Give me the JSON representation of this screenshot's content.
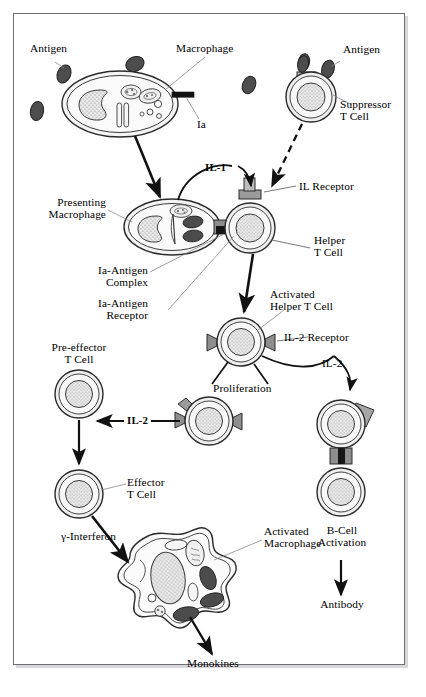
{
  "diagram": {
    "background": "#ffffff",
    "frame_color": "#6f6f72",
    "ink": "#1a1a1a",
    "cell_fill": "#f2f2f2",
    "nucleus_fill": "#e2e2e2",
    "receptor_fill": "#a8a8a8",
    "antigen_fill": "#4a4a4a"
  },
  "labels": {
    "antigen_left": "Antigen",
    "macrophage": "Macrophage",
    "antigen_right": "Antigen",
    "ia": "Ia",
    "suppressor_t_cell": "Suppressor\nT Cell",
    "il_1": "IL-1",
    "il_receptor": "IL Receptor",
    "presenting_macrophage": "Presenting\nMacrophage",
    "helper_t_cell": "Helper\nT Cell",
    "ia_antigen_complex": "Ia-Antigen\nComplex",
    "ia_antigen_receptor": "Ia-Antigen\nReceptor",
    "activated_helper_t_cell": "Activated\nHelper T Cell",
    "il_2_receptor": "IL-2 Receptor",
    "il_2_curve": "IL-2",
    "pre_effector_t_cell": "Pre-effector\nT Cell",
    "proliferation": "Proliferation",
    "il_2_arrow": "IL-2",
    "effector_t_cell": "Effector\nT Cell",
    "gamma_interferon": "γ-Interferon",
    "activated_macrophage": "Activated\nMacrophage",
    "monokines": "Monokines",
    "b_cell_activation": "B-Cell\nActivation",
    "antibody": "Antibody"
  },
  "cells": [
    {
      "name": "macrophage",
      "kind": "macrophage",
      "cx": 120,
      "cy": 104
    },
    {
      "name": "suppressor-t-cell",
      "kind": "t-cell",
      "cx": 311,
      "cy": 97
    },
    {
      "name": "presenting-macrophage",
      "kind": "macrophage",
      "cx": 172,
      "cy": 227
    },
    {
      "name": "helper-t-cell",
      "kind": "t-cell",
      "cx": 250,
      "cy": 228
    },
    {
      "name": "activated-helper-t-cell",
      "kind": "t-cell",
      "cx": 241,
      "cy": 342
    },
    {
      "name": "pre-effector-t-cell",
      "kind": "t-cell",
      "cx": 79,
      "cy": 394
    },
    {
      "name": "proliferating-t-cell",
      "kind": "t-cell",
      "cx": 209,
      "cy": 421
    },
    {
      "name": "effector-t-cell",
      "kind": "t-cell",
      "cx": 79,
      "cy": 494
    },
    {
      "name": "il2-bound-t-cell",
      "kind": "t-cell",
      "cx": 341,
      "cy": 424
    },
    {
      "name": "b-cell",
      "kind": "t-cell",
      "cx": 341,
      "cy": 492
    },
    {
      "name": "activated-macrophage",
      "kind": "amoeboid",
      "cx": 170,
      "cy": 583
    }
  ],
  "flows": [
    {
      "from": "macrophage",
      "to": "presenting-macrophage",
      "style": "solid"
    },
    {
      "from": "suppressor-t-cell",
      "to": "helper-t-cell",
      "style": "dashed"
    },
    {
      "from": "presenting-macrophage",
      "to": "helper-t-cell",
      "style": "arc",
      "label": "IL-1"
    },
    {
      "from": "helper-t-cell",
      "to": "activated-helper-t-cell",
      "style": "solid"
    },
    {
      "from": "activated-helper-t-cell",
      "to": "proliferating-t-cell",
      "style": "line",
      "label": "Proliferation"
    },
    {
      "from": "activated-helper-t-cell",
      "to": "il2-bound-t-cell",
      "style": "arc",
      "label": "IL-2"
    },
    {
      "from": "proliferating-t-cell",
      "to": "pre-effector-t-cell",
      "style": "solid",
      "label": "IL-2"
    },
    {
      "from": "pre-effector-t-cell",
      "to": "effector-t-cell",
      "style": "solid"
    },
    {
      "from": "effector-t-cell",
      "to": "activated-macrophage",
      "style": "solid",
      "label": "γ-Interferon"
    },
    {
      "from": "activated-macrophage",
      "to": "monokines",
      "style": "solid",
      "label": "Monokines"
    },
    {
      "from": "b-cell",
      "to": "antibody",
      "style": "solid",
      "label": "Antibody"
    }
  ]
}
